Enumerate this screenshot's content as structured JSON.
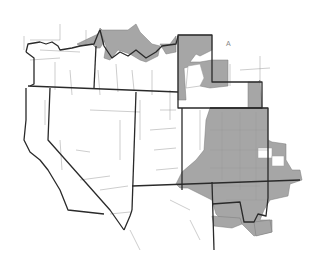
{
  "map": {
    "region": "Western United States",
    "states_shown": [
      "Washington",
      "Oregon",
      "Idaho",
      "Montana",
      "Wyoming",
      "California",
      "Nevada",
      "Utah",
      "Colorado",
      "Arizona",
      "New Mexico"
    ],
    "shaded_color": "#a6a6a6",
    "border_color": "#2a2a2a",
    "county_line_color": "#9a9a9a",
    "background": "#ffffff",
    "shaded_areas": [
      "northern Idaho/Montana border",
      "western Wyoming",
      "eastern Wyoming border strip",
      "central/eastern Colorado",
      "northern New Mexico",
      "eastern Utah edge"
    ],
    "compass_label": "A"
  }
}
